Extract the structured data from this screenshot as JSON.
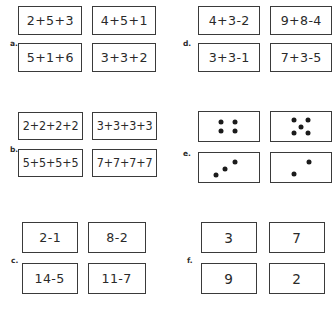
{
  "page": {
    "background_color": "#ffffff",
    "ink_color": "#2a2a2a",
    "border_color": "#3a3a3a"
  },
  "groups": [
    {
      "id": "a",
      "label": "a.",
      "kind": "expressions",
      "cards": [
        {
          "text": "2+5+3"
        },
        {
          "text": "4+5+1"
        },
        {
          "text": "5+1+6"
        },
        {
          "text": "3+3+2"
        }
      ]
    },
    {
      "id": "b",
      "label": "b.",
      "kind": "expressions",
      "cards": [
        {
          "text": "2+2+2+2"
        },
        {
          "text": "3+3+3+3"
        },
        {
          "text": "5+5+5+5"
        },
        {
          "text": "7+7+7+7"
        }
      ]
    },
    {
      "id": "c",
      "label": "c.",
      "kind": "expressions",
      "cards": [
        {
          "text": "2-1"
        },
        {
          "text": "8-2"
        },
        {
          "text": "14-5"
        },
        {
          "text": "11-7"
        }
      ]
    },
    {
      "id": "d",
      "label": "d.",
      "kind": "expressions",
      "cards": [
        {
          "text": "4+3-2"
        },
        {
          "text": "9+8-4"
        },
        {
          "text": "3+3-1"
        },
        {
          "text": "7+3-5"
        }
      ]
    },
    {
      "id": "e",
      "label": "e.",
      "kind": "dots",
      "cards": [
        {
          "dot_count": 4,
          "pattern": "square",
          "dots": [
            {
              "x": 36,
              "y": 33
            },
            {
              "x": 60,
              "y": 33
            },
            {
              "x": 36,
              "y": 66
            },
            {
              "x": 60,
              "y": 66
            }
          ]
        },
        {
          "dot_count": 5,
          "pattern": "quincunx",
          "dots": [
            {
              "x": 38,
              "y": 28
            },
            {
              "x": 62,
              "y": 28
            },
            {
              "x": 50,
              "y": 50
            },
            {
              "x": 38,
              "y": 72
            },
            {
              "x": 62,
              "y": 72
            }
          ]
        },
        {
          "dot_count": 3,
          "pattern": "diagonal",
          "dots": [
            {
              "x": 28,
              "y": 76
            },
            {
              "x": 44,
              "y": 56
            },
            {
              "x": 60,
              "y": 30
            }
          ]
        },
        {
          "dot_count": 2,
          "pattern": "diagonal",
          "dots": [
            {
              "x": 38,
              "y": 72
            },
            {
              "x": 64,
              "y": 30
            }
          ]
        }
      ]
    },
    {
      "id": "f",
      "label": "f.",
      "kind": "numbers",
      "cards": [
        {
          "text": "3"
        },
        {
          "text": "7"
        },
        {
          "text": "9"
        },
        {
          "text": "2"
        }
      ]
    }
  ]
}
